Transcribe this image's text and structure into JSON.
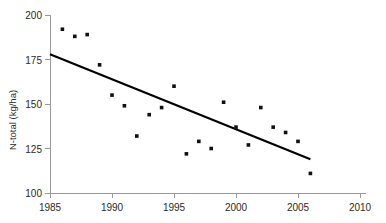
{
  "chart_data": {
    "type": "scatter",
    "title": "",
    "subtitle": "",
    "xlabel": "",
    "ylabel": "N-total (kg/ha)",
    "xlim": [
      1985,
      2010
    ],
    "ylim": [
      100,
      200
    ],
    "xticks": [
      1985,
      1990,
      1995,
      2000,
      2005,
      2010
    ],
    "yticks": [
      100,
      125,
      150,
      175,
      200
    ],
    "xtick_labels": [
      "1985",
      "1990",
      "1995",
      "2000",
      "2005",
      "2010"
    ],
    "ytick_labels": [
      "100",
      "125",
      "150",
      "175",
      "200"
    ],
    "grid": false,
    "legend": null,
    "legend_position": "none",
    "point_color": "#111111",
    "trend_color": "#000000",
    "axis_color": "#9a9a9a",
    "series": [
      {
        "name": "N-total",
        "marker": "square",
        "x": [
          1986,
          1987,
          1988,
          1989,
          1990,
          1991,
          1992,
          1993,
          1994,
          1995,
          1996,
          1997,
          1998,
          1999,
          2000,
          2001,
          2002,
          2003,
          2004,
          2005,
          2006
        ],
        "y": [
          192,
          188,
          189,
          172,
          155,
          149,
          132,
          144,
          148,
          160,
          122,
          129,
          125,
          151,
          137,
          127,
          148,
          137,
          134,
          129,
          111
        ]
      }
    ],
    "trendline": {
      "name": "linear-trend",
      "x": [
        1985,
        2006
      ],
      "y": [
        178,
        119
      ]
    },
    "annotations": []
  }
}
